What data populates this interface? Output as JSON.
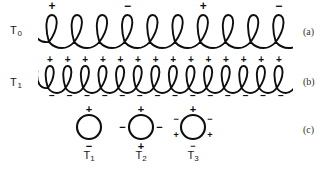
{
  "figure": {
    "title": "",
    "background_color": "#ffffff",
    "ink_color": "#0d0d0d",
    "rows": [
      {
        "id": "row-a",
        "temperature_label": "T",
        "temperature_sub": "0",
        "panel_label": "(a)",
        "coil_turns": 10,
        "sign_interval": 3,
        "top_signs": [
          "+",
          "−",
          "+",
          "−"
        ],
        "bottom_signs": []
      },
      {
        "id": "row-b",
        "temperature_label": "T",
        "temperature_sub": "1",
        "panel_label": "(b)",
        "coil_turns": 14,
        "sign_interval": 1,
        "top_signs": [
          "+",
          "+",
          "+",
          "+",
          "+",
          "+",
          "+",
          "+",
          "+",
          "+",
          "+",
          "+",
          "+",
          "+"
        ],
        "bottom_signs": [
          "−",
          "−",
          "−",
          "−",
          "−",
          "−",
          "−",
          "−",
          "−",
          "−",
          "−",
          "−",
          "−",
          "−"
        ]
      }
    ],
    "circles_row": {
      "id": "row-c",
      "panel_label": "(c)",
      "circles": [
        {
          "label": "T",
          "label_sub": "1",
          "cx": 89,
          "cy": 127,
          "r": 12,
          "charges": [
            {
              "sign": "+",
              "angle_deg": 270,
              "size": 11
            },
            {
              "sign": "−",
              "angle_deg": 90,
              "size": 11
            }
          ]
        },
        {
          "label": "T",
          "label_sub": "2",
          "cx": 141,
          "cy": 127,
          "r": 12,
          "charges": [
            {
              "sign": "+",
              "angle_deg": 270,
              "size": 11
            },
            {
              "sign": "+",
              "angle_deg": 90,
              "size": 11
            },
            {
              "sign": "−",
              "angle_deg": 180,
              "size": 11
            },
            {
              "sign": "−",
              "angle_deg": 0,
              "size": 11
            }
          ]
        },
        {
          "label": "T",
          "label_sub": "3",
          "cx": 193,
          "cy": 127,
          "r": 12,
          "charges": [
            {
              "sign": "+",
              "angle_deg": 270,
              "size": 11
            },
            {
              "sign": "−",
              "angle_deg": 90,
              "size": 9
            },
            {
              "sign": "−",
              "angle_deg": 205,
              "size": 9
            },
            {
              "sign": "−",
              "angle_deg": 335,
              "size": 9
            },
            {
              "sign": "+",
              "angle_deg": 155,
              "size": 9
            },
            {
              "sign": "+",
              "angle_deg": 25,
              "size": 9
            }
          ]
        }
      ]
    }
  }
}
